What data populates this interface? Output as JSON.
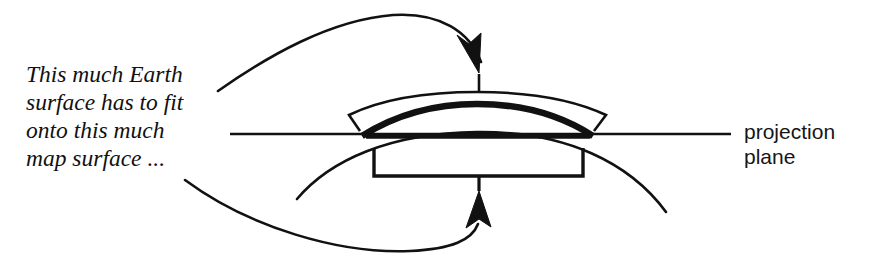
{
  "figure": {
    "background_color": "#ffffff",
    "ink_color": "#111111"
  },
  "annotations": {
    "callout": {
      "lines": [
        "This much Earth",
        "surface has to fit",
        "onto this much",
        "map surface ..."
      ],
      "text": "This much Earth\nsurface has to fit\nonto this much\nmap surface ...",
      "style": "italic-serif"
    },
    "plane_label": {
      "lines": [
        "projection",
        "plane"
      ],
      "text": "projection\nplane",
      "style": "sans-serif"
    }
  },
  "diagram_elements": {
    "earth_arc": {
      "name": "earth-surface-arc",
      "description": "thin curved arc representing the curved surface of the Earth",
      "stroke_width": 2.6
    },
    "earth_segment": {
      "name": "earth-surface-segment",
      "description": "thick bold arc marking the portion of Earth surface being projected",
      "stroke_width": 6.5
    },
    "map_band": {
      "name": "map-surface-band",
      "description": "outlined lens shaped band above the Earth segment representing the map surface",
      "stroke_width": 2.6
    },
    "projection_plane_line": {
      "name": "projection-plane-line",
      "description": "horizontal straight line representing the projection plane",
      "stroke_width": 2.2
    },
    "extent_bracket": {
      "name": "map-extent-bracket",
      "description": "square bracket beneath the plane marking the width of the map surface",
      "stroke_width": 3.4
    },
    "top_arrow": {
      "name": "earth-surface-pointer-arrow",
      "description": "curved arrow from the callout text up and over to the map surface apex"
    },
    "bottom_arrow": {
      "name": "map-surface-pointer-arrow",
      "description": "curved arrow from the callout text sweeping below to the extent bracket"
    }
  }
}
